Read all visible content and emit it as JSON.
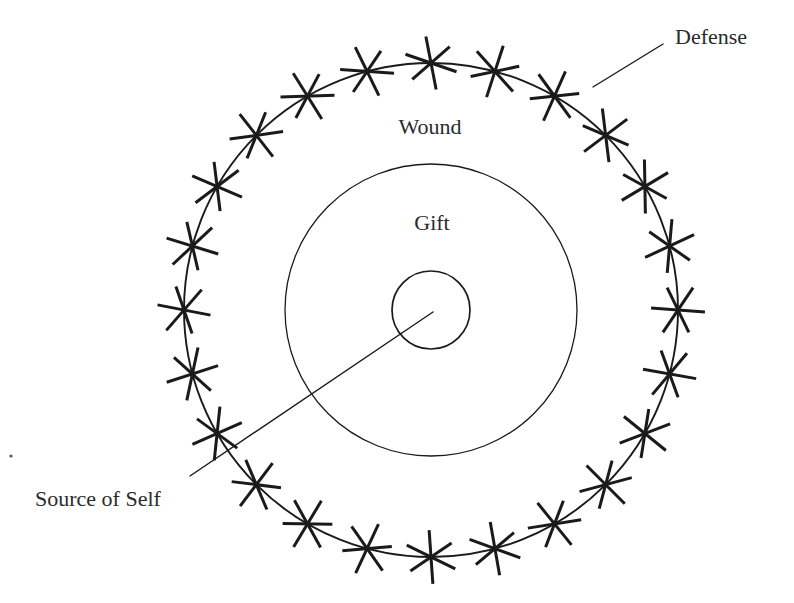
{
  "figure": {
    "background_color": "#ffffff",
    "ink_color": "#1a1a1a",
    "text_color": "#2b2b2b",
    "width": 794,
    "height": 603
  },
  "labels": {
    "defense": "Defense",
    "wound": "Wound",
    "gift": "Gift",
    "source_of_self": "Source of Self"
  },
  "chart_data": {
    "type": "diagram",
    "center": {
      "x": 431,
      "y": 310
    },
    "rings": [
      {
        "name": "source-of-self-ring",
        "label": "Source of Self",
        "radius": 39,
        "stroke_width": 1.7
      },
      {
        "name": "gift-ring",
        "label": "Gift",
        "radius": 146,
        "stroke_width": 1.3
      },
      {
        "name": "wound-ring",
        "label": "Wound",
        "radius": 247,
        "stroke_width": 1.9
      }
    ],
    "defenses": {
      "label": "Defense",
      "glyph": "six-pointed-asterisk",
      "count": 24,
      "ring_radius": 247,
      "arm_length": 27,
      "start_angle_deg": -90,
      "step_deg": 15,
      "stroke_width": 3.0
    },
    "label_positions": [
      {
        "key": "wound",
        "text": "Wound",
        "x": 430,
        "y": 134,
        "font_size": 22,
        "anchor": "middle"
      },
      {
        "key": "gift",
        "text": "Gift",
        "x": 432,
        "y": 230,
        "font_size": 22,
        "anchor": "middle"
      },
      {
        "key": "defense",
        "text": "Defense",
        "x": 675,
        "y": 44,
        "font_size": 22,
        "anchor": "start"
      },
      {
        "key": "source",
        "text": "Source of Self",
        "x": 35,
        "y": 506,
        "font_size": 22,
        "anchor": "start"
      }
    ],
    "leaders": [
      {
        "key": "defense-leader",
        "x1": 593,
        "y1": 87,
        "x2": 663,
        "y2": 44
      },
      {
        "key": "source-of-self-leader",
        "x1": 433,
        "y1": 312,
        "x2": 190,
        "y2": 476
      }
    ],
    "speck": {
      "x": 11,
      "y": 456,
      "r": 1.6
    }
  }
}
